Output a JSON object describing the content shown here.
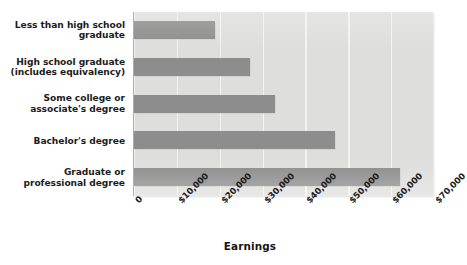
{
  "chart_data": {
    "type": "bar",
    "orientation": "horizontal",
    "title": "",
    "xlabel": "Earnings",
    "ylabel": "",
    "categories": [
      "Less than high school graduate",
      "High school graduate (includes equivalency)",
      "Some college or associate's degree",
      "Bachelor's degree",
      "Graduate or professional degree"
    ],
    "category_lines": [
      [
        "Less than high school",
        "graduate"
      ],
      [
        "High school graduate",
        "(includes equivalency)"
      ],
      [
        "Some college or",
        "associate's degree"
      ],
      [
        "Bachelor's degree"
      ],
      [
        "Graduate or",
        "professional degree"
      ]
    ],
    "values": [
      19000,
      27000,
      33000,
      47000,
      62000
    ],
    "xlim": [
      0,
      70000
    ],
    "xticks": [
      0,
      10000,
      20000,
      30000,
      40000,
      50000,
      60000,
      70000
    ],
    "xtick_labels": [
      "0",
      "$10,000",
      "$20,000",
      "$30,000",
      "$40,000",
      "$50,000",
      "$60,000",
      "$70,000"
    ],
    "grid": true,
    "grid_axis": "x",
    "legend": false,
    "colors": {
      "bar": "#8d8d8d",
      "plot_background": "#dededc",
      "gridline": "#f2f2f0",
      "axis_line": "#aeaeae",
      "text": "#1c1c1c",
      "page_background": "#ffffff"
    }
  }
}
